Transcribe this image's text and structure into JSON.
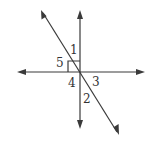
{
  "diagram": {
    "lines": [
      {
        "id": "horizontal",
        "name": "horizontal-line",
        "arrows": "both"
      },
      {
        "id": "vertical",
        "name": "vertical-line",
        "arrows": "both"
      },
      {
        "id": "diagonal",
        "name": "diagonal-line",
        "arrows": "both",
        "direction": "upper-left to lower-right"
      }
    ],
    "right_angle_marker": {
      "between": [
        "vertical-up",
        "horizontal-left"
      ]
    },
    "angle_labels": [
      {
        "id": "1",
        "text": "1",
        "position": "between vertical-up and diagonal-up"
      },
      {
        "id": "2",
        "text": "2",
        "position": "between vertical-down and diagonal-down"
      },
      {
        "id": "3",
        "text": "3",
        "position": "between horizontal-right and diagonal-down"
      },
      {
        "id": "4",
        "text": "4",
        "position": "between horizontal-left and vertical-down"
      },
      {
        "id": "5",
        "text": "5",
        "position": "between horizontal-left and diagonal-up"
      }
    ],
    "colors": {
      "stroke": "#3a3a3a",
      "text": "#333333",
      "background": "#ffffff"
    }
  }
}
